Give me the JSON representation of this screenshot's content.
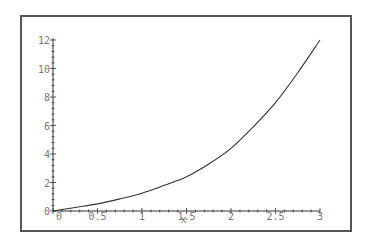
{
  "chart_data": {
    "type": "line",
    "title": "",
    "xlabel": "x",
    "ylabel": "",
    "xlim": [
      0,
      3
    ],
    "ylim": [
      0,
      12
    ],
    "grid": false,
    "legend": null,
    "x_ticks": [
      "0",
      "0.5",
      "1",
      "1.5",
      "2",
      "2.5",
      "3"
    ],
    "y_ticks": [
      "0",
      "2",
      "4",
      "6",
      "8",
      "10",
      "12"
    ],
    "series": [
      {
        "name": "f(x)",
        "color": "#333333",
        "x": [
          0,
          0.25,
          0.5,
          0.75,
          1,
          1.25,
          1.5,
          1.75,
          2,
          2.25,
          2.5,
          2.75,
          3
        ],
        "y": [
          0,
          0.25,
          0.5,
          0.85,
          1.25,
          1.8,
          2.4,
          3.3,
          4.4,
          5.9,
          7.6,
          9.7,
          12
        ]
      }
    ]
  },
  "axis_colors": {
    "frame": "#555555",
    "axis": "#333333",
    "labels": "#777777"
  }
}
